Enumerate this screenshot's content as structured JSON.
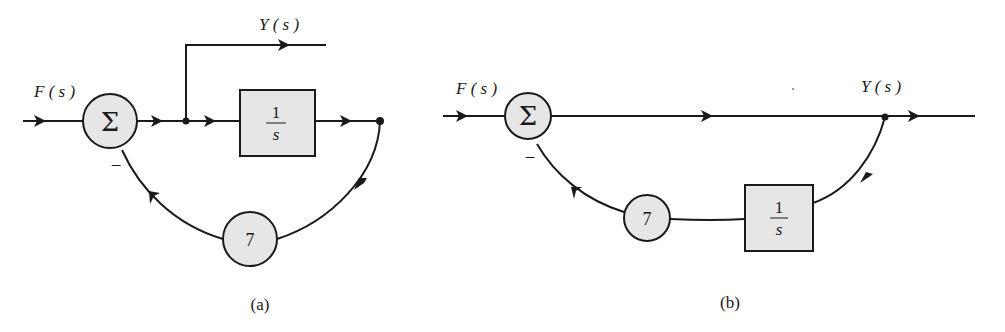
{
  "diagram": {
    "type": "block-diagram",
    "panels": [
      {
        "id": "a",
        "caption": "(a)",
        "input_label": "F ( s )",
        "output_label": "Y ( s )",
        "summer_symbol": "Σ",
        "feedback_sign": "–",
        "forward_block": {
          "numerator": "1",
          "denominator": "s"
        },
        "feedback_gain": "7"
      },
      {
        "id": "b",
        "caption": "(b)",
        "input_label": "F ( s )",
        "output_label": "Y ( s )",
        "summer_symbol": "Σ",
        "feedback_sign": "–",
        "feedback_block": {
          "numerator": "1",
          "denominator": "s"
        },
        "feedback_gain": "7"
      }
    ],
    "colors": {
      "line": "#1a1a1a",
      "fill": "#e6e6e6",
      "background": "#ffffff"
    }
  }
}
